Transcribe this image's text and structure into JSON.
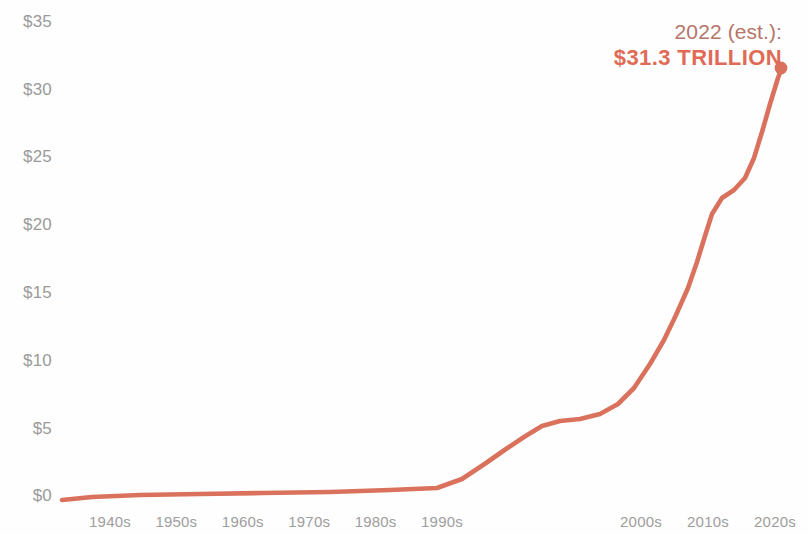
{
  "chart_data": {
    "type": "line",
    "title": "",
    "subtitle": "",
    "xlabel": "",
    "ylabel": "",
    "categories": [
      "1940s",
      "1950s",
      "1960s",
      "1970s",
      "1980s",
      "1990s",
      "2000s",
      "2010s",
      "2020s"
    ],
    "x_tick_labels": [
      "1940s",
      "1950s",
      "1960s",
      "1970s",
      "1980s",
      "1990s",
      "2000s",
      "2010s",
      "2020s"
    ],
    "y_tick_labels": [
      "$0",
      "$5",
      "$10",
      "$15",
      "$20",
      "$25",
      "$30",
      "$35"
    ],
    "y_tick_values": [
      0,
      5,
      10,
      15,
      20,
      25,
      30,
      35
    ],
    "ylim": [
      0,
      35
    ],
    "units": "trillions of US dollars",
    "grid": false,
    "legend": "none",
    "line_color": "#d9715c",
    "endpoint_marker": true,
    "series": [
      {
        "name": "US National Debt",
        "values": [
          0.3,
          0.3,
          0.4,
          0.5,
          1.0,
          4.2,
          5.7,
          13.6,
          31.3
        ],
        "points": [
          {
            "x": "1940s",
            "y": 0.3
          },
          {
            "x": "1945",
            "y": 0.26
          },
          {
            "x": "1950s",
            "y": 0.3
          },
          {
            "x": "1960s",
            "y": 0.35
          },
          {
            "x": "1970s",
            "y": 0.45
          },
          {
            "x": "1978",
            "y": 0.6
          },
          {
            "x": "1980s",
            "y": 1.0
          },
          {
            "x": "1985",
            "y": 1.9
          },
          {
            "x": "1990s",
            "y": 4.2
          },
          {
            "x": "1996",
            "y": 5.2
          },
          {
            "x": "2000s",
            "y": 5.7
          },
          {
            "x": "2005",
            "y": 8.0
          },
          {
            "x": "2008",
            "y": 10.0
          },
          {
            "x": "2010s",
            "y": 13.6
          },
          {
            "x": "2014",
            "y": 17.8
          },
          {
            "x": "2016",
            "y": 19.6
          },
          {
            "x": "2019",
            "y": 22.7
          },
          {
            "x": "2020s",
            "y": 27.0
          },
          {
            "x": "2022",
            "y": 31.3
          }
        ]
      }
    ],
    "annotations": [
      {
        "name": "endpoint-callout",
        "line1": "2022 (est.):",
        "line2": "$31.3 TRILLION",
        "value": 31.3,
        "x": "2022",
        "color_line1": "#b5756a",
        "color_line2": "#e06a55"
      }
    ]
  },
  "axes": {
    "y": {
      "ticks": [
        {
          "label": "$35",
          "value": 35
        },
        {
          "label": "$30",
          "value": 30
        },
        {
          "label": "$25",
          "value": 25
        },
        {
          "label": "$20",
          "value": 20
        },
        {
          "label": "$15",
          "value": 15
        },
        {
          "label": "$10",
          "value": 10
        },
        {
          "label": "$5",
          "value": 5
        },
        {
          "label": "$0",
          "value": 0
        }
      ]
    },
    "x": {
      "ticks": [
        {
          "label": "1940s"
        },
        {
          "label": "1950s"
        },
        {
          "label": "1960s"
        },
        {
          "label": "1970s"
        },
        {
          "label": "1980s"
        },
        {
          "label": "1990s"
        },
        {
          "label": "2000s"
        },
        {
          "label": "2010s"
        },
        {
          "label": "2020s"
        }
      ]
    }
  },
  "callout": {
    "line1": "2022 (est.):",
    "line2": "$31.3 TRILLION"
  }
}
